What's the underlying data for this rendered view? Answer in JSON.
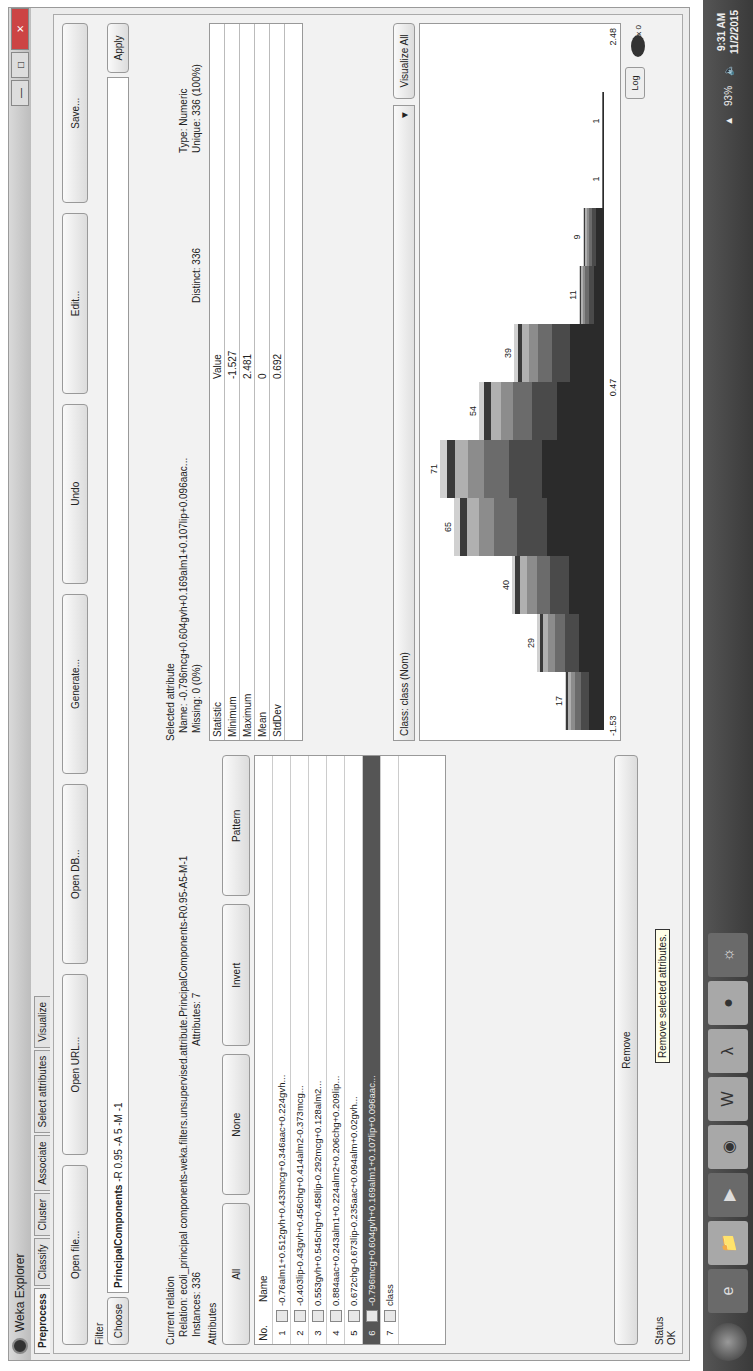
{
  "window": {
    "title": "Weka Explorer",
    "controls": [
      "minimize",
      "maximize",
      "close"
    ]
  },
  "tabs": [
    {
      "label": "Preprocess",
      "active": true
    },
    {
      "label": "Classify",
      "active": false
    },
    {
      "label": "Cluster",
      "active": false
    },
    {
      "label": "Associate",
      "active": false
    },
    {
      "label": "Select attributes",
      "active": false
    },
    {
      "label": "Visualize",
      "active": false
    }
  ],
  "toolbar": {
    "open_file": "Open file...",
    "open_url": "Open URL...",
    "open_db": "Open DB...",
    "generate": "Generate...",
    "undo": "Undo",
    "edit": "Edit...",
    "save": "Save..."
  },
  "filter": {
    "label": "Filter",
    "choose_label": "Choose",
    "filter_name": "PrincipalComponents",
    "filter_options": "-R 0.95 -A 5 -M -1",
    "apply_label": "Apply"
  },
  "current_relation": {
    "heading": "Current relation",
    "relation_label": "Relation:",
    "relation_value": "ecoli_principal components-weka.filters.unsupervised.attribute.PrincipalComponents-R0.95-A5-M-1",
    "instances_label": "Instances:",
    "instances_value": "336",
    "attributes_label": "Attributes:",
    "attributes_value": "7"
  },
  "attributes": {
    "heading": "Attributes",
    "buttons": {
      "all": "All",
      "none": "None",
      "invert": "Invert",
      "pattern": "Pattern"
    },
    "columns": {
      "no": "No.",
      "name": "Name"
    },
    "rows": [
      {
        "no": "1",
        "name": "-0.76alm1+0.512gvh+0.433mcg+0.346aac+0.224gvh...",
        "selected": false
      },
      {
        "no": "2",
        "name": "-0.403lip-0.43gvh+0.456chg+0.414alm2-0.373mcg...",
        "selected": false
      },
      {
        "no": "3",
        "name": "0.553gvh+0.545chg+0.458lip-0.292mcg+0.128alm2...",
        "selected": false
      },
      {
        "no": "4",
        "name": "0.884aac+0.243alm1+0.224alm2+0.206chg+0.209lip...",
        "selected": false
      },
      {
        "no": "5",
        "name": "0.672chg-0.673lip-0.235aac+0.094alm+0.02gvh...",
        "selected": false
      },
      {
        "no": "6",
        "name": "-0.796mcg+0.604gvh+0.169alm1+0.107lip+0.096aac...",
        "selected": true
      },
      {
        "no": "7",
        "name": "class",
        "selected": false
      }
    ],
    "remove_label": "Remove",
    "remove_tooltip": "Remove selected attributes."
  },
  "selected_attribute": {
    "heading": "Selected attribute",
    "name_label": "Name:",
    "name_value": "-0.796mcg+0.604gvh+0.169alm1+0.107lip+0.096aac...",
    "missing_label": "Missing:",
    "missing_value": "0 (0%)",
    "distinct_label": "Distinct:",
    "distinct_value": "336",
    "type_label": "Type:",
    "type_value": "Numeric",
    "unique_label": "Unique:",
    "unique_value": "336 (100%)",
    "stats_columns": {
      "statistic": "Statistic",
      "value": "Value"
    },
    "stats": [
      {
        "statistic": "Minimum",
        "value": "-1.527"
      },
      {
        "statistic": "Maximum",
        "value": "2.481"
      },
      {
        "statistic": "Mean",
        "value": "0"
      },
      {
        "statistic": "StdDev",
        "value": "0.692"
      }
    ]
  },
  "class_select": {
    "value": "Class: class (Nom)",
    "visualize_all": "Visualize All"
  },
  "histogram": {
    "x_min_label": "-1.53",
    "x_mid_label": "0.47",
    "x_max_label": "2.48",
    "log_label": "Log",
    "x_counter": "x 0",
    "colors": [
      "#2b2b2b",
      "#4a4a4a",
      "#6b6b6b",
      "#8c8c8c",
      "#b0b0b0",
      "#3a3a3a",
      "#d0d0d0"
    ]
  },
  "chart_data": {
    "type": "bar",
    "xlabel": "",
    "ylabel": "",
    "x_range": [
      -1.53,
      2.48
    ],
    "categories": [
      "b1",
      "b2",
      "b3",
      "b4",
      "b5",
      "b6",
      "b7",
      "b8",
      "b9",
      "b10",
      "b11",
      "b12"
    ],
    "values": [
      17,
      29,
      40,
      65,
      71,
      54,
      39,
      11,
      9,
      1,
      1,
      0
    ],
    "bar_labels": [
      "17",
      "29",
      "40",
      "65",
      "71",
      "54",
      "39",
      "11",
      "9",
      "1",
      "1",
      ""
    ]
  },
  "status": {
    "heading": "Status",
    "value": "OK"
  },
  "taskbar": {
    "apps": [
      "internet-explorer",
      "file-explorer",
      "media-player",
      "chrome",
      "word",
      "acrobat",
      "app-dark",
      "app-media"
    ],
    "time": "9:31 AM",
    "date": "11/2/2015",
    "battery": "93%"
  }
}
